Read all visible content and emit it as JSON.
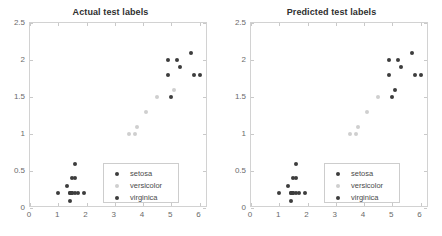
{
  "figure": {
    "width": 442,
    "height": 236,
    "background": "#ffffff"
  },
  "colors": {
    "setosa": "#3d3d3d",
    "versicolor": "#cfcfcf",
    "virginica": "#3d3d3d",
    "axis": "#d2d2d2",
    "tick_label": "#6a6a6a",
    "title": "#2f2f2f",
    "legend_border": "#cdcdcd"
  },
  "panels": [
    {
      "id": "actual",
      "title": "Actual test labels",
      "axes": {
        "xlabel": "",
        "ylabel": "",
        "xlim": [
          0,
          6.3
        ],
        "ylim": [
          0,
          2.5
        ],
        "xticks": [
          0,
          1,
          2,
          3,
          4,
          5,
          6
        ],
        "xticklabels": [
          "0",
          "1",
          "2",
          "3",
          "4",
          "5",
          "6"
        ],
        "yticks": [
          0,
          0.5,
          1,
          1.5,
          2,
          2.5
        ],
        "yticklabels": [
          "0",
          "0.5",
          "1",
          "1.5",
          "2",
          "2.5"
        ],
        "grid": false
      },
      "legend": {
        "position": "lower right",
        "entries": [
          {
            "label": "setosa",
            "color": "#3d3d3d"
          },
          {
            "label": "versicolor",
            "color": "#cfcfcf"
          },
          {
            "label": "virginica",
            "color": "#3d3d3d"
          }
        ]
      }
    },
    {
      "id": "predicted",
      "title": "Predicted test labels",
      "axes": {
        "xlabel": "",
        "ylabel": "",
        "xlim": [
          0,
          6.3
        ],
        "ylim": [
          0,
          2.5
        ],
        "xticks": [
          0,
          1,
          2,
          3,
          4,
          5,
          6
        ],
        "xticklabels": [
          "0",
          "1",
          "2",
          "3",
          "4",
          "5",
          "6"
        ],
        "yticks": [
          0,
          0.5,
          1,
          1.5,
          2,
          2.5
        ],
        "yticklabels": [
          "0",
          "0.5",
          "1",
          "1.5",
          "2",
          "2.5"
        ],
        "grid": false
      },
      "legend": {
        "position": "lower right",
        "entries": [
          {
            "label": "setosa",
            "color": "#3d3d3d"
          },
          {
            "label": "versicolor",
            "color": "#cfcfcf"
          },
          {
            "label": "virginica",
            "color": "#3d3d3d"
          }
        ]
      }
    }
  ],
  "chart_data": [
    {
      "type": "scatter",
      "title": "Actual test labels",
      "xlabel": "",
      "ylabel": "",
      "xlim": [
        0,
        6.3
      ],
      "ylim": [
        0,
        2.5
      ],
      "xticks": [
        0,
        1,
        2,
        3,
        4,
        5,
        6
      ],
      "yticks": [
        0,
        0.5,
        1,
        1.5,
        2,
        2.5
      ],
      "grid": false,
      "legend": "lower right",
      "series": [
        {
          "name": "setosa",
          "color": "#3d3d3d",
          "points": [
            [
              1.0,
              0.2
            ],
            [
              1.3,
              0.3
            ],
            [
              1.4,
              0.1
            ],
            [
              1.4,
              0.2
            ],
            [
              1.4,
              0.2
            ],
            [
              1.5,
              0.2
            ],
            [
              1.5,
              0.2
            ],
            [
              1.5,
              0.4
            ],
            [
              1.6,
              0.2
            ],
            [
              1.6,
              0.4
            ],
            [
              1.6,
              0.6
            ],
            [
              1.7,
              0.2
            ],
            [
              1.9,
              0.2
            ]
          ]
        },
        {
          "name": "versicolor",
          "color": "#cfcfcf",
          "points": [
            [
              3.5,
              1.0
            ],
            [
              3.7,
              1.0
            ],
            [
              3.8,
              1.1
            ],
            [
              4.1,
              1.3
            ],
            [
              4.5,
              1.5
            ],
            [
              5.1,
              1.6
            ]
          ]
        },
        {
          "name": "virginica",
          "color": "#3d3d3d",
          "points": [
            [
              4.9,
              1.8
            ],
            [
              4.9,
              2.0
            ],
            [
              5.0,
              1.5
            ],
            [
              5.2,
              2.0
            ],
            [
              5.3,
              1.9
            ],
            [
              5.7,
              2.1
            ],
            [
              5.8,
              1.8
            ],
            [
              6.0,
              1.8
            ]
          ]
        }
      ]
    },
    {
      "type": "scatter",
      "title": "Predicted test labels",
      "xlabel": "",
      "ylabel": "",
      "xlim": [
        0,
        6.3
      ],
      "ylim": [
        0,
        2.5
      ],
      "xticks": [
        0,
        1,
        2,
        3,
        4,
        5,
        6
      ],
      "yticks": [
        0,
        0.5,
        1,
        1.5,
        2,
        2.5
      ],
      "grid": false,
      "legend": "lower right",
      "series": [
        {
          "name": "setosa",
          "color": "#3d3d3d",
          "points": [
            [
              1.0,
              0.2
            ],
            [
              1.3,
              0.3
            ],
            [
              1.4,
              0.1
            ],
            [
              1.4,
              0.2
            ],
            [
              1.4,
              0.2
            ],
            [
              1.5,
              0.2
            ],
            [
              1.5,
              0.2
            ],
            [
              1.5,
              0.4
            ],
            [
              1.6,
              0.2
            ],
            [
              1.6,
              0.4
            ],
            [
              1.6,
              0.6
            ],
            [
              1.7,
              0.2
            ],
            [
              1.9,
              0.2
            ]
          ]
        },
        {
          "name": "versicolor",
          "color": "#cfcfcf",
          "points": [
            [
              3.5,
              1.0
            ],
            [
              3.7,
              1.0
            ],
            [
              3.8,
              1.1
            ],
            [
              4.1,
              1.3
            ],
            [
              4.5,
              1.5
            ]
          ]
        },
        {
          "name": "virginica",
          "color": "#3d3d3d",
          "points": [
            [
              4.9,
              1.8
            ],
            [
              4.9,
              2.0
            ],
            [
              5.0,
              1.5
            ],
            [
              5.1,
              1.6
            ],
            [
              5.2,
              2.0
            ],
            [
              5.3,
              1.9
            ],
            [
              5.7,
              2.1
            ],
            [
              5.8,
              1.8
            ],
            [
              6.0,
              1.8
            ]
          ]
        }
      ]
    }
  ]
}
